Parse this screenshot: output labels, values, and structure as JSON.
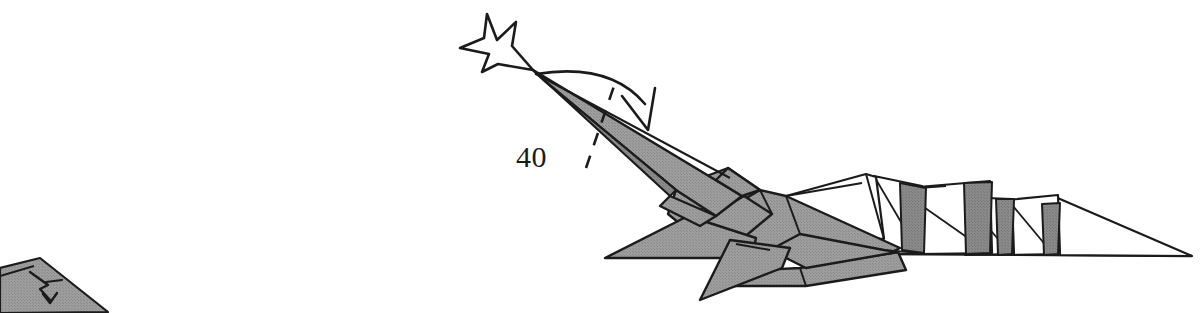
{
  "page": {
    "kind": "origami-instruction-diagram",
    "width": 1202,
    "height": 313,
    "background_color": "#ffffff"
  },
  "labels": {
    "step_number": "40"
  },
  "colors": {
    "paper_front_gray": "#9a9a9a",
    "paper_back_white": "#ffffff",
    "paper_shadow_gray": "#868686",
    "ink_black": "#1b1b1b",
    "edge_stroke": "#111111",
    "text_color": "#1b1b1b",
    "background": "#ffffff"
  },
  "figure": {
    "name": "folded-paper-creature",
    "parts": [
      {
        "name": "head-neck",
        "fill": "paper_front_gray"
      },
      {
        "name": "body",
        "fill": "paper_front_gray"
      },
      {
        "name": "front-leg-spike",
        "fill": "paper_front_gray"
      },
      {
        "name": "rear-leg-spike",
        "fill": "paper_front_gray"
      },
      {
        "name": "belly-flap",
        "fill": "paper_front_gray"
      },
      {
        "name": "pleated-tail",
        "fill": "paper_back_white"
      },
      {
        "name": "tail-tip",
        "fill": "paper_back_white"
      }
    ]
  },
  "annotations": {
    "push_arrow": {
      "name": "push-in-arrow",
      "style": "hollow-outline",
      "points_to": "head-tip",
      "tip_x": 533,
      "tip_y": 70
    },
    "fold_arrow": {
      "name": "valley-fold-arrow",
      "style": "curved-hollow-arrowhead",
      "direction": "clockwise-down",
      "start_x": 536,
      "start_y": 74,
      "end_x": 648,
      "end_y": 110
    },
    "fold_line": {
      "name": "dashed-fold-line",
      "style": "dashed",
      "x1": 586,
      "y1": 168,
      "x2": 614,
      "y2": 86
    }
  },
  "cropped_neighbor": {
    "name": "next-step-fragment",
    "position": "bottom-left",
    "description": "partially cropped adjacent diagram with small V arrow"
  }
}
